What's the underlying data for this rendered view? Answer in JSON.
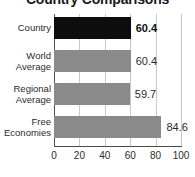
{
  "chart_data": {
    "type": "bar",
    "orientation": "horizontal",
    "title": "Country Comparisons",
    "xlabel": "",
    "ylabel": "",
    "xlim": [
      0,
      100
    ],
    "xticks": [
      0,
      20,
      40,
      60,
      80,
      100
    ],
    "xtick_labels": [
      "0",
      "20",
      "40",
      "60",
      "80",
      "100"
    ],
    "grid": true,
    "legend": "none",
    "categories": [
      "Country",
      "World Average",
      "Regional Average",
      "Free Economies"
    ],
    "values": [
      60.4,
      60.4,
      59.7,
      84.6
    ],
    "value_labels": [
      "60.4",
      "60.4",
      "59.7",
      "84.6"
    ],
    "colors": {
      "highlight_bar": "#0d0d0d",
      "default_bar": "#8a8a8a",
      "gridline": "#c9c9c9",
      "axis": "#4a4a4a",
      "text": "#2b2b2b"
    },
    "bars": [
      {
        "category": "Country",
        "label_lines": [
          "Country"
        ],
        "value": 60.4,
        "value_label": "60.4",
        "emphasis": true,
        "color": "#0d0d0d"
      },
      {
        "category": "World Average",
        "label_lines": [
          "World",
          "Average"
        ],
        "value": 60.4,
        "value_label": "60.4",
        "emphasis": false,
        "color": "#8a8a8a"
      },
      {
        "category": "Regional Average",
        "label_lines": [
          "Regional",
          "Average"
        ],
        "value": 59.7,
        "value_label": "59.7",
        "emphasis": false,
        "color": "#8a8a8a"
      },
      {
        "category": "Free Economies",
        "label_lines": [
          "Free",
          "Economies"
        ],
        "value": 84.6,
        "value_label": "84.6",
        "emphasis": false,
        "color": "#8a8a8a"
      }
    ]
  }
}
